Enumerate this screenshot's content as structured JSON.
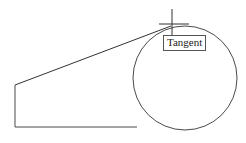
{
  "figure": {
    "canvas": {
      "width": 246,
      "height": 143,
      "background": "#ffffff"
    },
    "stroke_color": "#4a4a4a",
    "stroke_color_dark": "#333333",
    "stroke_width": 1,
    "label": {
      "text": "Tangent",
      "border_color": "#555555",
      "text_color": "#1a1a1a",
      "x": 163,
      "y": 35
    },
    "circle": {
      "center_x": 185,
      "center_y": 78,
      "radius": 52
    },
    "tangent_line": {
      "x1": 15,
      "y1": 85,
      "x2": 171,
      "y2": 26
    },
    "left_wall": {
      "x1": 15,
      "y1": 85,
      "x2": 15,
      "y2": 127
    },
    "base_line": {
      "x1": 15,
      "y1": 127,
      "x2": 137,
      "y2": 127
    },
    "crosshair": {
      "center_x": 172,
      "center_y": 24,
      "vertical_top": 9,
      "vertical_bottom": 36,
      "horizontal_left": 159,
      "horizontal_right": 189
    }
  }
}
